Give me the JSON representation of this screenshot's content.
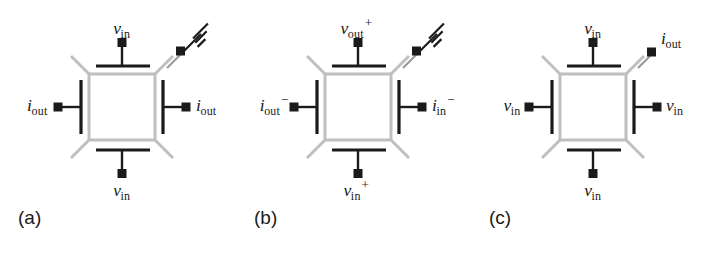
{
  "figure": {
    "background_color": "#ffffff",
    "body_color": "#bfbfbf",
    "line_color": "#1a1a1a",
    "panel_count": 3
  },
  "panels": [
    {
      "id": "a",
      "caption": "(a)",
      "has_ground": true,
      "ground_terminal_corner": "top-right",
      "terminals": [
        {
          "position": "top",
          "name": "top-terminal",
          "symbol": "v",
          "sub": "in",
          "sup": ""
        },
        {
          "position": "bottom",
          "name": "bottom-terminal",
          "symbol": "v",
          "sub": "in",
          "sup": ""
        },
        {
          "position": "left",
          "name": "left-terminal",
          "symbol": "i",
          "sub": "out",
          "sup": ""
        },
        {
          "position": "right",
          "name": "right-terminal",
          "symbol": "i",
          "sub": "out",
          "sup": ""
        },
        {
          "position": "corner-top-right",
          "name": "ground-terminal",
          "symbol": "",
          "sub": "",
          "sup": ""
        }
      ]
    },
    {
      "id": "b",
      "caption": "(b)",
      "has_ground": true,
      "ground_terminal_corner": "top-right",
      "terminals": [
        {
          "position": "top",
          "name": "top-terminal",
          "symbol": "v",
          "sub": "out",
          "sup": "+"
        },
        {
          "position": "bottom",
          "name": "bottom-terminal",
          "symbol": "v",
          "sub": "in",
          "sup": "+"
        },
        {
          "position": "left",
          "name": "left-terminal",
          "symbol": "i",
          "sub": "out",
          "sup": "−"
        },
        {
          "position": "right",
          "name": "right-terminal",
          "symbol": "i",
          "sub": "in",
          "sup": "−"
        },
        {
          "position": "corner-top-right",
          "name": "ground-terminal",
          "symbol": "",
          "sub": "",
          "sup": ""
        }
      ]
    },
    {
      "id": "c",
      "caption": "(c)",
      "has_ground": false,
      "ground_terminal_corner": "",
      "terminals": [
        {
          "position": "top",
          "name": "top-terminal",
          "symbol": "v",
          "sub": "in",
          "sup": ""
        },
        {
          "position": "bottom",
          "name": "bottom-terminal",
          "symbol": "v",
          "sub": "in",
          "sup": ""
        },
        {
          "position": "left",
          "name": "left-terminal",
          "symbol": "v",
          "sub": "in",
          "sup": ""
        },
        {
          "position": "right",
          "name": "right-terminal",
          "symbol": "v",
          "sub": "in",
          "sup": ""
        },
        {
          "position": "corner-top-right",
          "name": "corner-terminal",
          "symbol": "i",
          "sub": "out",
          "sup": ""
        }
      ]
    }
  ]
}
